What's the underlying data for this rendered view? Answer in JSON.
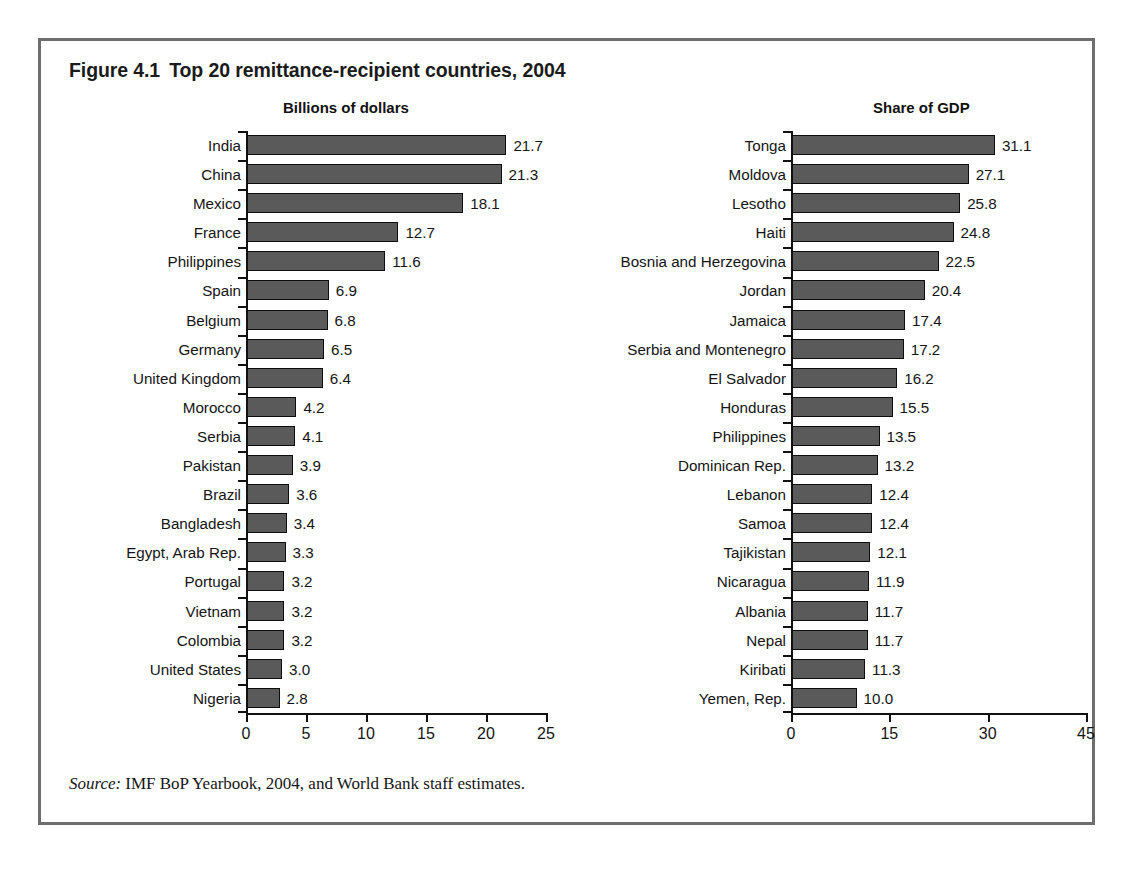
{
  "figure": {
    "number": "Figure 4.1",
    "title": "Top 20 remittance-recipient countries, 2004",
    "source_word": "Source:",
    "source_text": "IMF BoP Yearbook, 2004, and World Bank staff estimates.",
    "bar_color": "#5a5a5a",
    "frame_color": "#6e6e6e"
  },
  "chart_data": [
    {
      "type": "bar",
      "orientation": "horizontal",
      "title": "Billions of dollars",
      "xlabel": "",
      "ylabel": "",
      "xlim": [
        0,
        25
      ],
      "xticks": [
        0,
        5,
        10,
        15,
        20,
        25
      ],
      "xtick_labels": [
        "0",
        "5",
        "10",
        "15",
        "20",
        "25"
      ],
      "grid": false,
      "legend": "none",
      "categories": [
        "India",
        "China",
        "Mexico",
        "France",
        "Philippines",
        "Spain",
        "Belgium",
        "Germany",
        "United Kingdom",
        "Morocco",
        "Serbia",
        "Pakistan",
        "Brazil",
        "Bangladesh",
        "Egypt, Arab Rep.",
        "Portugal",
        "Vietnam",
        "Colombia",
        "United States",
        "Nigeria"
      ],
      "values": [
        21.7,
        21.3,
        18.1,
        12.7,
        11.6,
        6.9,
        6.8,
        6.5,
        6.4,
        4.2,
        4.1,
        3.9,
        3.6,
        3.4,
        3.3,
        3.2,
        3.2,
        3.2,
        3.0,
        2.8
      ],
      "value_labels": [
        "21.7",
        "21.3",
        "18.1",
        "12.7",
        "11.6",
        "6.9",
        "6.8",
        "6.5",
        "6.4",
        "4.2",
        "4.1",
        "3.9",
        "3.6",
        "3.4",
        "3.3",
        "3.2",
        "3.2",
        "3.2",
        "3.0",
        "2.8"
      ]
    },
    {
      "type": "bar",
      "orientation": "horizontal",
      "title": "Share of GDP",
      "xlabel": "",
      "ylabel": "",
      "xlim": [
        0,
        45
      ],
      "xticks": [
        0,
        15,
        30,
        45
      ],
      "xtick_labels": [
        "0",
        "15",
        "30",
        "45"
      ],
      "grid": false,
      "legend": "none",
      "categories": [
        "Tonga",
        "Moldova",
        "Lesotho",
        "Haiti",
        "Bosnia and Herzegovina",
        "Jordan",
        "Jamaica",
        "Serbia and Montenegro",
        "El Salvador",
        "Honduras",
        "Philippines",
        "Dominican Rep.",
        "Lebanon",
        "Samoa",
        "Tajikistan",
        "Nicaragua",
        "Albania",
        "Nepal",
        "Kiribati",
        "Yemen, Rep."
      ],
      "values": [
        31.1,
        27.1,
        25.8,
        24.8,
        22.5,
        20.4,
        17.4,
        17.2,
        16.2,
        15.5,
        13.5,
        13.2,
        12.4,
        12.4,
        12.1,
        11.9,
        11.7,
        11.7,
        11.3,
        10.0
      ],
      "value_labels": [
        "31.1",
        "27.1",
        "25.8",
        "24.8",
        "22.5",
        "20.4",
        "17.4",
        "17.2",
        "16.2",
        "15.5",
        "13.5",
        "13.2",
        "12.4",
        "12.4",
        "12.1",
        "11.9",
        "11.7",
        "11.7",
        "11.3",
        "10.0"
      ]
    }
  ]
}
